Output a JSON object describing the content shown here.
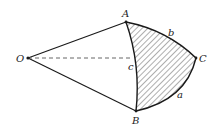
{
  "diagram": {
    "type": "spherical-triangle",
    "colors": {
      "stroke": "#1a1a1a",
      "hatch": "#333333",
      "dashed": "#555555",
      "background": "#ffffff"
    },
    "points": {
      "O": {
        "label": "O",
        "x": 28,
        "y": 58
      },
      "A": {
        "label": "A",
        "x": 126,
        "y": 22
      },
      "B": {
        "label": "B",
        "x": 136,
        "y": 111
      },
      "C": {
        "label": "C",
        "x": 196,
        "y": 58
      }
    },
    "arcs": {
      "a": {
        "label": "a",
        "from": "B",
        "to": "C"
      },
      "b": {
        "label": "b",
        "from": "A",
        "to": "C"
      },
      "c": {
        "label": "c",
        "from": "A",
        "to": "B"
      }
    },
    "segments": [
      {
        "from": "O",
        "to": "A",
        "style": "solid"
      },
      {
        "from": "O",
        "to": "B",
        "style": "solid"
      },
      {
        "from": "O",
        "to": "C",
        "style": "dashed"
      }
    ],
    "shaded_region": "ABC"
  }
}
